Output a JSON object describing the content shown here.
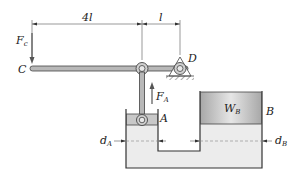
{
  "diagram": {
    "dimensions": {
      "left_span": "4l",
      "right_span": "l"
    },
    "points": {
      "C": "C",
      "D": "D",
      "A": "A",
      "B": "B"
    },
    "forces": {
      "Fc_main": "F",
      "Fc_sub": "c",
      "FA_main": "F",
      "FA_sub": "A"
    },
    "weight": {
      "main": "W",
      "sub": "B"
    },
    "diameters": {
      "dA_main": "d",
      "dA_sub": "A",
      "dB_main": "d",
      "dB_sub": "B"
    },
    "colors": {
      "outline": "#333333",
      "lever_fill": "#b8b8b8",
      "fluid_fill": "#eaeaea",
      "piston_A_fill": "#c8c8c8",
      "piston_B_fill": "#c4c4c4"
    }
  }
}
